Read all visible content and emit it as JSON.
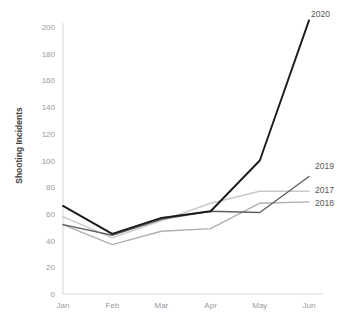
{
  "chart_data": {
    "type": "line",
    "title": "",
    "xlabel": "",
    "ylabel": "Shooting Incidents",
    "categories": [
      "Jan",
      "Feb",
      "Mar",
      "Apr",
      "May",
      "Jun"
    ],
    "ylim": [
      0,
      200
    ],
    "y_ticks": [
      "0",
      "20",
      "40",
      "60",
      "80",
      "100",
      "120",
      "140",
      "160",
      "180",
      "200"
    ],
    "y_tick_values": [
      0,
      20,
      40,
      60,
      80,
      100,
      120,
      140,
      160,
      180,
      200
    ],
    "grid": false,
    "legend_position": "right-inline-end-labels",
    "series": [
      {
        "name": "2017",
        "label": "2017",
        "color": "#c9c9c9",
        "values": [
          58,
          42,
          55,
          68,
          77,
          77
        ]
      },
      {
        "name": "2018",
        "label": "2018",
        "color": "#b0b0b0",
        "values": [
          52,
          37,
          47,
          49,
          68,
          69
        ]
      },
      {
        "name": "2019",
        "label": "2019",
        "color": "#606060",
        "values": [
          52,
          44,
          56,
          62,
          61,
          88
        ]
      },
      {
        "name": "2020",
        "label": "2020",
        "color": "#1a1a1a",
        "values": [
          66,
          45,
          57,
          62,
          100,
          205
        ]
      }
    ]
  },
  "axis": {
    "y_title": "Shooting Incidents"
  }
}
